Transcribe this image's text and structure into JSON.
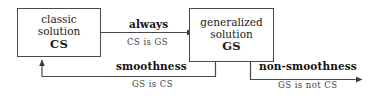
{
  "diagram": {
    "type": "flow-diagram",
    "background_color": "#ffffff",
    "line_color": "#4a4a4a",
    "text_color": "#1b1b1b",
    "nodes": [
      {
        "id": "cs",
        "line1": "classic",
        "line2": "solution",
        "abbr": "CS"
      },
      {
        "id": "gs",
        "line1": "generalized",
        "line2": "solution",
        "abbr": "GS"
      }
    ],
    "edges": [
      {
        "id": "always",
        "label": "always",
        "sublabel": "CS is GS",
        "from": "cs",
        "to": "gs",
        "direction": "right"
      },
      {
        "id": "smoothness",
        "label": "smoothness",
        "sublabel": "GS is CS",
        "from": "gs",
        "to": "cs",
        "direction": "left-up"
      },
      {
        "id": "non-smoothness",
        "label": "non-smoothness",
        "sublabel": "GS is not CS",
        "from": "gs",
        "to": "",
        "direction": "right"
      }
    ]
  }
}
